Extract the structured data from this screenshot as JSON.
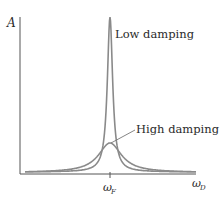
{
  "chart_data": {
    "type": "line",
    "title": "",
    "xlabel": "ωD",
    "ylabel": "A",
    "x_tick_labels": [
      "ωF"
    ],
    "grid": false,
    "legend": "none",
    "annotations": [
      "Low damping",
      "High damping"
    ],
    "series": [
      {
        "name": "Low damping",
        "description": "sharp resonance peak at ωF, very large amplitude",
        "peak_x": "ωF",
        "peak_relative_height": 1.0
      },
      {
        "name": "High damping",
        "description": "broad low resonance peak at ωF",
        "peak_x": "ωF",
        "peak_relative_height": 0.2
      }
    ]
  },
  "labels": {
    "y_axis": "A",
    "x_axis_main": "ω",
    "x_axis_sub": "D",
    "tick_main": "ω",
    "tick_sub": "F",
    "low_damping": "Low damping",
    "high_damping": "High damping"
  },
  "colors": {
    "curve": "#8a8a8a",
    "axis": "#555555",
    "text": "#2a2a2a"
  }
}
